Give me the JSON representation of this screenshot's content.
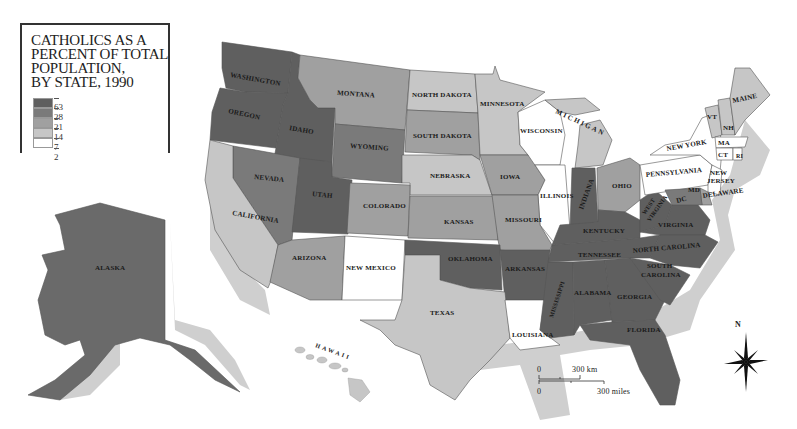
{
  "legend": {
    "title_lines": [
      "CATHOLICS AS A",
      "PERCENT OF TOTAL",
      "POPULATION,",
      "BY STATE, 1990"
    ],
    "ticks": [
      "63",
      "28",
      "21",
      "14",
      "7",
      "2"
    ],
    "classes": [
      {
        "range": "28-63",
        "color": "#5f5f5f"
      },
      {
        "range": "21-28",
        "color": "#7a7a7a"
      },
      {
        "range": "14-21",
        "color": "#a0a0a0"
      },
      {
        "range": "7-14",
        "color": "#c6c6c6"
      },
      {
        "range": "2-7",
        "color": "#ffffff"
      }
    ]
  },
  "states": {
    "washington": "WASHINGTON",
    "oregon": "OREGON",
    "idaho": "IDAHO",
    "montana": "MONTANA",
    "wyoming": "WYOMING",
    "north_dakota": "NORTH DAKOTA",
    "south_dakota": "SOUTH DAKOTA",
    "minnesota": "MINNESOTA",
    "wisconsin": "WISCONSIN",
    "michigan": "MICHIGAN",
    "nebraska": "NEBRASKA",
    "iowa": "IOWA",
    "illinois": "ILLINOIS",
    "indiana": "INDIANA",
    "ohio": "OHIO",
    "nevada": "NEVADA",
    "utah": "UTAH",
    "colorado": "COLORADO",
    "california": "CALIFORNIA",
    "kansas": "KANSAS",
    "missouri": "MISSOURI",
    "arizona": "ARIZONA",
    "new_mexico": "NEW MEXICO",
    "oklahoma": "OKLAHOMA",
    "arkansas": "ARKANSAS",
    "texas": "TEXAS",
    "louisiana": "LOUISIANA",
    "mississippi": "MISSISSIPPI",
    "alabama": "ALABAMA",
    "georgia": "GEORGIA",
    "florida": "FLORIDA",
    "tennessee": "TENNESSEE",
    "kentucky": "KENTUCKY",
    "west_virginia_1": "WEST",
    "west_virginia_2": "VIRGINIA",
    "virginia": "VIRGINIA",
    "north_carolina": "NORTH CAROLINA",
    "south_carolina_1": "SOUTH",
    "south_carolina_2": "CAROLINA",
    "pennsylvania": "PENNSYLVANIA",
    "new_york": "NEW YORK",
    "new_jersey_1": "NEW",
    "new_jersey_2": "JERSEY",
    "delaware": "DELAWARE",
    "maryland": "MD",
    "dc": "DC",
    "vermont": "VT",
    "new_hampshire": "NH",
    "maine": "MAINE",
    "massachusetts": "MA",
    "connecticut": "CT",
    "rhode_island": "RI",
    "alaska": "ALASKA",
    "hawaii": "HAWAII"
  },
  "scale_bar": {
    "km_zero": "0",
    "km_label": "300 km",
    "mi_zero": "0",
    "mi_label": "300 miles"
  },
  "compass": {
    "north_label": "N"
  }
}
